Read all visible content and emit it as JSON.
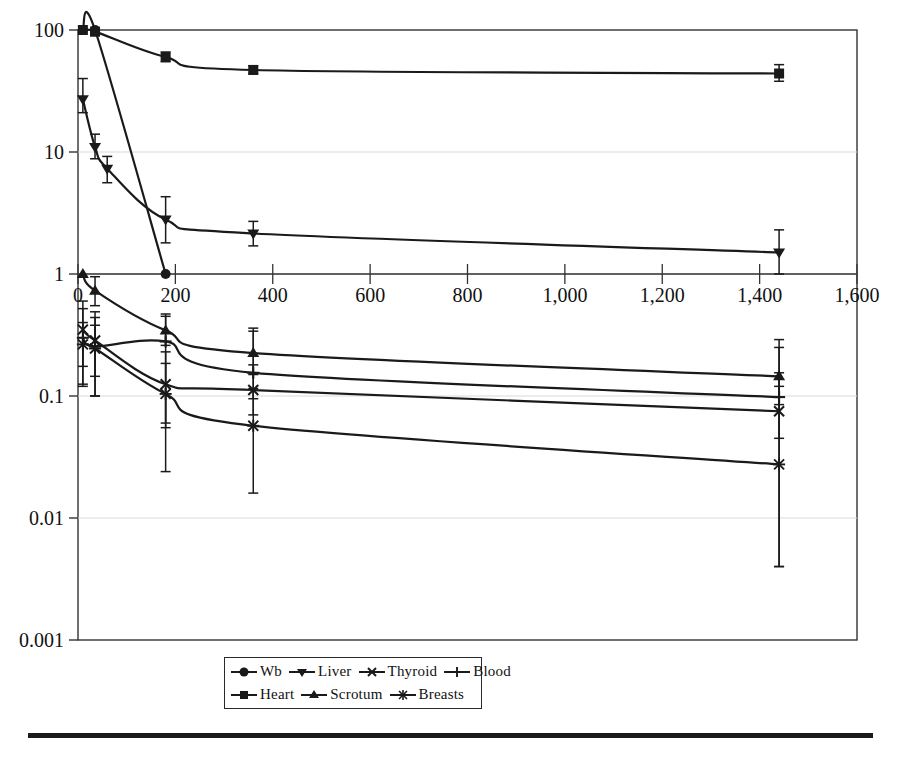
{
  "chart_data": {
    "type": "line",
    "title": "",
    "xlabel": "",
    "ylabel": "",
    "xlim": [
      0,
      1600
    ],
    "ylim": [
      0.001,
      100
    ],
    "yscale": "log",
    "xscale": "linear",
    "grid": "horizontal-decades-light",
    "xticks": [
      0,
      200,
      400,
      600,
      800,
      1000,
      1200,
      1400,
      1600
    ],
    "xticklabels": [
      "0",
      "200",
      "400",
      "600",
      "800",
      "1,000",
      "1,200",
      "1,400",
      "1,600"
    ],
    "yticks": [
      0.001,
      0.01,
      0.1,
      1,
      10,
      100
    ],
    "yticklabels": [
      "0.001",
      "0.01",
      "0.1",
      "1",
      "10",
      "100"
    ],
    "x": [
      10,
      35,
      180,
      360,
      1440
    ],
    "legend_position": "bottom-center",
    "series": [
      {
        "name": "Wb",
        "marker": "circle",
        "values": [
          100,
          100,
          1.0,
          null,
          null
        ],
        "points": [
          {
            "x": 10,
            "y": 100,
            "lo": 100,
            "hi": 100
          },
          {
            "x": 35,
            "y": 100,
            "lo": 92,
            "hi": 112
          },
          {
            "x": 180,
            "y": 1.0,
            "lo": 1.0,
            "hi": 1.0
          }
        ]
      },
      {
        "name": "Heart",
        "marker": "square",
        "points": [
          {
            "x": 10,
            "y": 100,
            "lo": 100,
            "hi": 100
          },
          {
            "x": 35,
            "y": 97,
            "lo": 90,
            "hi": 110
          },
          {
            "x": 180,
            "y": 60,
            "lo": 55,
            "hi": 66
          },
          {
            "x": 360,
            "y": 47,
            "lo": 44,
            "hi": 51
          },
          {
            "x": 1440,
            "y": 44,
            "lo": 38,
            "hi": 52
          }
        ]
      },
      {
        "name": "Liver",
        "marker": "triangle-down",
        "points": [
          {
            "x": 10,
            "y": 27,
            "lo": 21,
            "hi": 40
          },
          {
            "x": 35,
            "y": 11,
            "lo": 8.8,
            "hi": 14
          },
          {
            "x": 60,
            "y": 7.3,
            "lo": 5.6,
            "hi": 9.2
          },
          {
            "x": 180,
            "y": 2.8,
            "lo": 1.8,
            "hi": 4.3
          },
          {
            "x": 360,
            "y": 2.15,
            "lo": 1.7,
            "hi": 2.7
          },
          {
            "x": 1440,
            "y": 1.5,
            "lo": 1.0,
            "hi": 2.3
          }
        ]
      },
      {
        "name": "Scrotum",
        "marker": "triangle-up",
        "points": [
          {
            "x": 10,
            "y": 1.0,
            "lo": 1.0,
            "hi": 1.0
          },
          {
            "x": 35,
            "y": 0.73,
            "lo": 0.55,
            "hi": 0.95
          },
          {
            "x": 180,
            "y": 0.345,
            "lo": 0.26,
            "hi": 0.47
          },
          {
            "x": 360,
            "y": 0.225,
            "lo": 0.15,
            "hi": 0.36
          },
          {
            "x": 1440,
            "y": 0.145,
            "lo": 0.085,
            "hi": 0.25
          }
        ]
      },
      {
        "name": "Thyroid",
        "marker": "x-cross",
        "points": [
          {
            "x": 10,
            "y": 0.35,
            "lo": 0.175,
            "hi": 0.52
          },
          {
            "x": 35,
            "y": 0.285,
            "lo": 0.145,
            "hi": 0.44
          },
          {
            "x": 180,
            "y": 0.125,
            "lo": 0.055,
            "hi": 0.23
          },
          {
            "x": 360,
            "y": 0.112,
            "lo": 0.07,
            "hi": 0.18
          },
          {
            "x": 1440,
            "y": 0.075,
            "lo": 0.045,
            "hi": 0.12
          }
        ]
      },
      {
        "name": "Blood",
        "marker": "plus",
        "points": [
          {
            "x": 10,
            "y": 0.3,
            "lo": 0.125,
            "hi": 0.6
          },
          {
            "x": 35,
            "y": 0.255,
            "lo": 0.1,
            "hi": 0.49
          },
          {
            "x": 180,
            "y": 0.28,
            "lo": 0.06,
            "hi": 0.45
          },
          {
            "x": 360,
            "y": 0.155,
            "lo": 0.095,
            "hi": 0.34
          },
          {
            "x": 1440,
            "y": 0.098,
            "lo": 0.004,
            "hi": 0.29
          }
        ]
      },
      {
        "name": "Breasts",
        "marker": "asterisk",
        "points": [
          {
            "x": 10,
            "y": 0.265,
            "lo": 0.12,
            "hi": 0.4
          },
          {
            "x": 35,
            "y": 0.245,
            "lo": 0.1,
            "hi": 0.38
          },
          {
            "x": 180,
            "y": 0.104,
            "lo": 0.024,
            "hi": 0.185
          },
          {
            "x": 360,
            "y": 0.057,
            "lo": 0.016,
            "hi": 0.115
          },
          {
            "x": 1440,
            "y": 0.0275,
            "lo": 0.004,
            "hi": 0.155
          }
        ]
      }
    ]
  },
  "legend": {
    "rows": [
      [
        {
          "label": "Wb",
          "marker": "circle"
        },
        {
          "label": "Liver",
          "marker": "triangle-down"
        },
        {
          "label": "Thyroid",
          "marker": "x-cross"
        },
        {
          "label": "Blood",
          "marker": "plus"
        }
      ],
      [
        {
          "label": "Heart",
          "marker": "square"
        },
        {
          "label": "Scrotum",
          "marker": "triangle-up"
        },
        {
          "label": "Breasts",
          "marker": "asterisk"
        }
      ]
    ]
  },
  "colors": {
    "ink": "#1a1a1a",
    "grid": "#d9d9d9",
    "axis": "#333333",
    "background": "#ffffff"
  }
}
